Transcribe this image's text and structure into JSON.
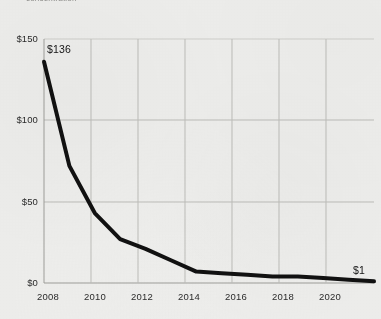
{
  "header": {
    "title_cutoff": "concentration"
  },
  "chart_data": {
    "type": "line",
    "title": "",
    "xlabel": "",
    "ylabel": "",
    "x": [
      2008,
      2009,
      2010,
      2011,
      2012,
      2013,
      2014,
      2015,
      2016,
      2017,
      2018,
      2019,
      2020,
      2021
    ],
    "values": [
      136,
      72,
      43,
      27,
      21,
      14,
      7,
      6,
      5,
      4,
      4,
      3,
      2,
      1
    ],
    "series": [
      {
        "name": "cost",
        "values": [
          136,
          72,
          43,
          27,
          21,
          14,
          7,
          6,
          5,
          4,
          4,
          3,
          2,
          1
        ]
      }
    ],
    "ylim": [
      0,
      150
    ],
    "xlim": [
      2008,
      2021
    ],
    "yticks": [
      0,
      50,
      100,
      150
    ],
    "ytick_labels": [
      "$0",
      "$50",
      "$100",
      "$150"
    ],
    "xticks": [
      2008,
      2010,
      2012,
      2014,
      2016,
      2018,
      2020
    ],
    "xtick_labels": [
      "2008",
      "2010",
      "2012",
      "2014",
      "2016",
      "2018",
      "2020"
    ],
    "grid": true,
    "legend": "none",
    "line_color": "#111111",
    "line_width": 4,
    "annotations": [
      {
        "label": "$136",
        "x": 2008,
        "y": 136,
        "position": "above-right"
      },
      {
        "label": "$1",
        "x": 2021,
        "y": 1,
        "position": "above-left"
      }
    ]
  },
  "axis": {
    "y_tick_0": "$0",
    "y_tick_50": "$50",
    "y_tick_100": "$100",
    "y_tick_150": "$150",
    "x_tick_2008": "2008",
    "x_tick_2010": "2010",
    "x_tick_2012": "2012",
    "x_tick_2014": "2014",
    "x_tick_2016": "2016",
    "x_tick_2018": "2018",
    "x_tick_2020": "2020"
  },
  "annotations": {
    "start_value": "$136",
    "end_value": "$1"
  },
  "colors": {
    "background": "#eeeeec",
    "line": "#111111",
    "grid": "#b9b9b5",
    "text": "#2b2b2b"
  }
}
